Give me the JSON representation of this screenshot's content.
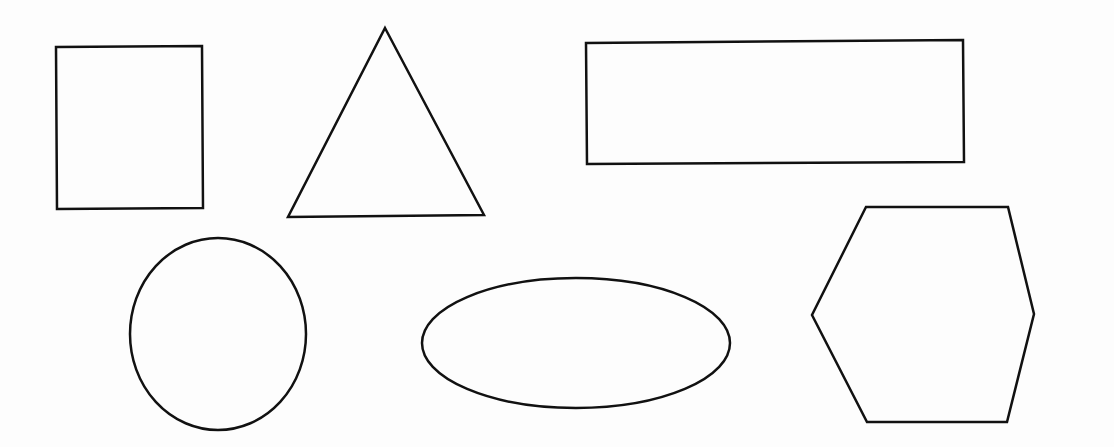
{
  "canvas": {
    "width": 1114,
    "height": 447,
    "background": "#fdfdfd",
    "stroke": "#111111",
    "stroke_width": 2.5
  },
  "shapes": [
    {
      "name": "square",
      "type": "polygon",
      "points": [
        [
          56,
          47
        ],
        [
          202,
          46
        ],
        [
          203,
          208
        ],
        [
          57,
          209
        ]
      ]
    },
    {
      "name": "triangle",
      "type": "polygon",
      "points": [
        [
          385,
          28
        ],
        [
          484,
          215
        ],
        [
          288,
          217
        ]
      ]
    },
    {
      "name": "rectangle",
      "type": "polygon",
      "points": [
        [
          586,
          43
        ],
        [
          963,
          40
        ],
        [
          964,
          162
        ],
        [
          587,
          164
        ]
      ]
    },
    {
      "name": "circle",
      "type": "ellipse",
      "cx": 218,
      "cy": 334,
      "rx": 88,
      "ry": 96
    },
    {
      "name": "ellipse",
      "type": "ellipse",
      "cx": 576,
      "cy": 343,
      "rx": 154,
      "ry": 65
    },
    {
      "name": "hexagon",
      "type": "polygon",
      "points": [
        [
          866,
          207
        ],
        [
          1008,
          207
        ],
        [
          1034,
          314
        ],
        [
          1007,
          422
        ],
        [
          867,
          422
        ],
        [
          812,
          315
        ]
      ]
    }
  ]
}
